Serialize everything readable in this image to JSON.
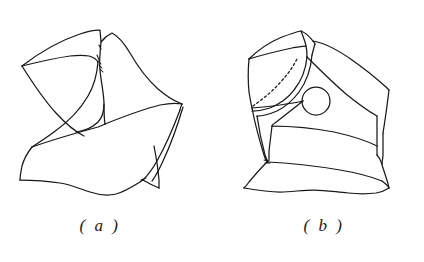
{
  "figure": {
    "background_color": "#ffffff",
    "ink_color": "#17181a",
    "panels": [
      {
        "id": "panel-a",
        "caption": "( a )",
        "description": "Faceted solid with deep concave notch cut into the upper left, sweeping curved ridge, broad lower facet and thin wedge sliver on the right edge",
        "features": [
          "outer-contour",
          "upper-notch-cut",
          "curved-ridge",
          "lower-broad-facet",
          "right-wedge-sliver",
          "wavy-bottom-break-edge",
          "short-tick-marks"
        ]
      },
      {
        "id": "panel-b",
        "caption": "( b )",
        "description": "Blocky faceted solid with flat quadrilateral top-left face, dashed hidden curve, circular hole on the main front facet, banded lower facet and wavy bottom break edge",
        "features": [
          "outer-contour",
          "top-ridge",
          "left-quad-facet",
          "hidden-dashed-curve",
          "circular-hole",
          "front-facet",
          "right-side-facet",
          "lower-band-facet",
          "wavy-bottom-break-edge"
        ]
      }
    ],
    "circle_hole": {
      "center_x": 316,
      "center_y": 101,
      "radius": 14
    }
  }
}
